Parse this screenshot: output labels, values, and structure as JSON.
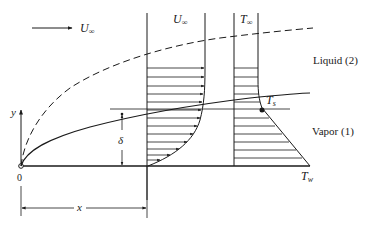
{
  "diagram": {
    "labels": {
      "freestream_velocity": "U",
      "freestream_velocity_sub": "∞",
      "profile_velocity": "U",
      "profile_velocity_sub": "∞",
      "profile_temperature": "T",
      "profile_temperature_sub": "∞",
      "liquid_region": "Liquid (2)",
      "vapor_region": "Vapor (1)",
      "saturation_temp": "T",
      "saturation_temp_sub": "s",
      "wall_temp": "T",
      "wall_temp_sub": "w",
      "y_axis": "y",
      "origin": "0",
      "delta": "δ",
      "x_dimension": "x"
    },
    "colors": {
      "ink": "#1a1a1a",
      "background": "#ffffff"
    }
  }
}
